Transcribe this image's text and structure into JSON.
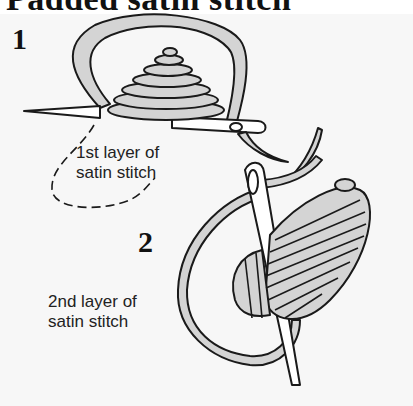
{
  "figure": {
    "title": "Padded satin stitch",
    "steps": [
      {
        "number": "1",
        "caption_line1": "1st layer of",
        "caption_line2": "satin stitch"
      },
      {
        "number": "2",
        "caption_line1": "2nd layer of",
        "caption_line2": "satin stitch"
      }
    ],
    "colors": {
      "thread_fill": "#d4d4d4",
      "outline": "#1a1a1a",
      "background": "#f7f7f7"
    }
  }
}
